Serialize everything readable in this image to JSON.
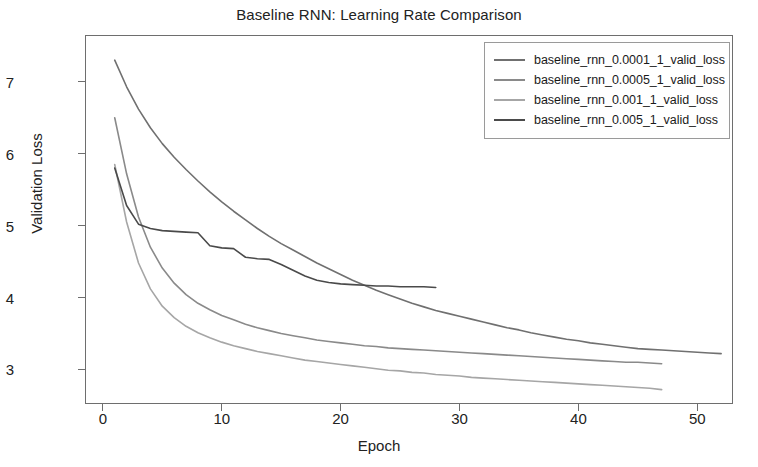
{
  "chart_data": {
    "type": "line",
    "title": "Baseline RNN: Learning Rate Comparison",
    "xlabel": "Epoch",
    "ylabel": "Validation Loss",
    "xlim": [
      -1.5,
      53.0
    ],
    "ylim": [
      2.52,
      7.65
    ],
    "xticks": [
      0,
      10,
      20,
      30,
      40,
      50
    ],
    "yticks": [
      3,
      4,
      5,
      6,
      7
    ],
    "grid": false,
    "legend_position": "upper right",
    "background": "#ffffff",
    "frame_color": "#6e6e6e",
    "series": [
      {
        "name": "baseline_rnn_0.0001_1_valid_loss",
        "color": "#707070",
        "x": [
          1,
          2,
          3,
          4,
          5,
          6,
          7,
          8,
          9,
          10,
          11,
          12,
          13,
          14,
          15,
          16,
          17,
          18,
          19,
          20,
          21,
          22,
          23,
          24,
          25,
          26,
          27,
          28,
          29,
          30,
          31,
          32,
          33,
          34,
          35,
          36,
          37,
          38,
          39,
          40,
          41,
          42,
          43,
          44,
          45,
          46,
          47,
          48,
          49,
          50,
          51,
          52
        ],
        "y": [
          7.3,
          6.93,
          6.62,
          6.36,
          6.14,
          5.95,
          5.78,
          5.62,
          5.47,
          5.33,
          5.2,
          5.08,
          4.96,
          4.85,
          4.75,
          4.66,
          4.57,
          4.48,
          4.4,
          4.32,
          4.24,
          4.17,
          4.1,
          4.04,
          3.98,
          3.92,
          3.87,
          3.82,
          3.78,
          3.74,
          3.7,
          3.66,
          3.62,
          3.58,
          3.55,
          3.51,
          3.48,
          3.45,
          3.42,
          3.4,
          3.37,
          3.35,
          3.33,
          3.31,
          3.29,
          3.28,
          3.27,
          3.26,
          3.25,
          3.24,
          3.23,
          3.22
        ]
      },
      {
        "name": "baseline_rnn_0.0005_1_valid_loss",
        "color": "#8a8a8a",
        "x": [
          1,
          2,
          3,
          4,
          5,
          6,
          7,
          8,
          9,
          10,
          11,
          12,
          13,
          14,
          15,
          16,
          17,
          18,
          19,
          20,
          21,
          22,
          23,
          24,
          25,
          26,
          27,
          28,
          29,
          30,
          31,
          32,
          33,
          34,
          35,
          36,
          37,
          38,
          39,
          40,
          41,
          42,
          43,
          44,
          45,
          46,
          47
        ],
        "y": [
          6.5,
          5.72,
          5.12,
          4.7,
          4.41,
          4.2,
          4.04,
          3.92,
          3.83,
          3.75,
          3.69,
          3.63,
          3.58,
          3.54,
          3.5,
          3.47,
          3.44,
          3.41,
          3.39,
          3.37,
          3.35,
          3.33,
          3.32,
          3.3,
          3.29,
          3.28,
          3.27,
          3.26,
          3.25,
          3.24,
          3.23,
          3.22,
          3.21,
          3.2,
          3.19,
          3.18,
          3.17,
          3.16,
          3.15,
          3.14,
          3.13,
          3.12,
          3.11,
          3.1,
          3.1,
          3.09,
          3.08
        ]
      },
      {
        "name": "baseline_rnn_0.001_1_valid_loss",
        "color": "#a6a6a6",
        "x": [
          1,
          2,
          3,
          4,
          5,
          6,
          7,
          8,
          9,
          10,
          11,
          12,
          13,
          14,
          15,
          16,
          17,
          18,
          19,
          20,
          21,
          22,
          23,
          24,
          25,
          26,
          27,
          28,
          29,
          30,
          31,
          32,
          33,
          34,
          35,
          36,
          37,
          38,
          39,
          40,
          41,
          42,
          43,
          44,
          45,
          46,
          47
        ],
        "y": [
          5.85,
          5.05,
          4.48,
          4.12,
          3.88,
          3.72,
          3.6,
          3.51,
          3.44,
          3.38,
          3.33,
          3.29,
          3.25,
          3.22,
          3.19,
          3.16,
          3.13,
          3.11,
          3.09,
          3.07,
          3.05,
          3.03,
          3.01,
          2.99,
          2.98,
          2.96,
          2.95,
          2.93,
          2.92,
          2.91,
          2.89,
          2.88,
          2.87,
          2.86,
          2.85,
          2.84,
          2.83,
          2.82,
          2.81,
          2.8,
          2.79,
          2.78,
          2.77,
          2.76,
          2.75,
          2.74,
          2.72
        ]
      },
      {
        "name": "baseline_rnn_0.005_1_valid_loss",
        "color": "#4a4a4a",
        "x": [
          1,
          2,
          3,
          4,
          5,
          6,
          7,
          8,
          9,
          10,
          11,
          12,
          13,
          14,
          15,
          16,
          17,
          18,
          19,
          20,
          21,
          22,
          23,
          24,
          25,
          26,
          27,
          28
        ],
        "y": [
          5.8,
          5.28,
          5.02,
          4.96,
          4.93,
          4.92,
          4.91,
          4.9,
          4.72,
          4.69,
          4.68,
          4.56,
          4.54,
          4.53,
          4.46,
          4.38,
          4.3,
          4.24,
          4.21,
          4.19,
          4.18,
          4.17,
          4.16,
          4.16,
          4.15,
          4.15,
          4.15,
          4.14
        ]
      }
    ]
  },
  "legend": {
    "entries": [
      {
        "label": "baseline_rnn_0.0001_1_valid_loss",
        "color": "#707070"
      },
      {
        "label": "baseline_rnn_0.0005_1_valid_loss",
        "color": "#8a8a8a"
      },
      {
        "label": "baseline_rnn_0.001_1_valid_loss",
        "color": "#a6a6a6"
      },
      {
        "label": "baseline_rnn_0.005_1_valid_loss",
        "color": "#4a4a4a"
      }
    ]
  }
}
